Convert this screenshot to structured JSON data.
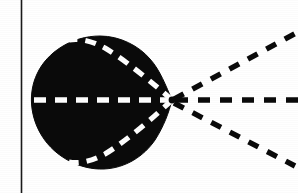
{
  "figure": {
    "kind": "scanned-line-drawing",
    "background_color": "#ffffff",
    "ink_color": "#0a0a0a",
    "highlight_color": "#ffffff",
    "canvas": {
      "width": 298,
      "height": 193
    }
  },
  "border_rule": {
    "name": "left-vertical-rule",
    "orientation": "vertical",
    "x": 21.5,
    "y1": 0,
    "y2": 193,
    "thickness": 1.6,
    "color": "#1a1a1a"
  },
  "lobe": {
    "name": "main-lobe-blob",
    "fill": "#0a0a0a",
    "description": "Solid black cardioid-like blob, round at left, converging to a point at the right",
    "vertex": {
      "x": 172,
      "y": 100
    },
    "bounds": {
      "left": 33,
      "top": 36,
      "right": 174,
      "bottom": 169
    },
    "outline_path": "M 172 100 C 166 86 160 70 150 59 C 139 46 120 36 100 36 C 72 36 47 52 37 74 C 28 93 30 117 42 136 C 55 157 80 170 104 169 C 126 168 144 156 155 140 C 164 126 169 112 172 100 Z"
  },
  "inner_dashed_rays": [
    {
      "name": "inner-ray-upper",
      "color": "#ffffff",
      "width": 5.2,
      "dash": "11 8",
      "path": "M 172 100 C 155 85 128 62 105 48 C 92 41 80 38 69 40"
    },
    {
      "name": "inner-ray-axis",
      "color": "#ffffff",
      "width": 5.4,
      "dash": "12 9",
      "path": "M 172 100 L 31 100"
    },
    {
      "name": "inner-ray-lower",
      "color": "#ffffff",
      "width": 5.2,
      "dash": "11 8",
      "path": "M 172 100 C 155 116 128 140 105 154 C 92 161 80 164 69 162"
    }
  ],
  "outer_dashed_rays": [
    {
      "name": "outer-ray-upper",
      "color": "#0a0a0a",
      "width": 5.4,
      "dash": "11 10",
      "path": "M 174 99 L 296 33"
    },
    {
      "name": "outer-ray-axis",
      "color": "#0a0a0a",
      "width": 5.6,
      "dash": "12 10",
      "path": "M 176 100 L 298 100"
    },
    {
      "name": "outer-ray-lower",
      "color": "#0a0a0a",
      "width": 5.4,
      "dash": "11 10",
      "path": "M 174 103 L 295 166"
    }
  ],
  "vertex_marker": {
    "name": "convergence-vertex",
    "x": 172,
    "y": 100,
    "radius": 3.4,
    "color": "#0a0a0a"
  }
}
